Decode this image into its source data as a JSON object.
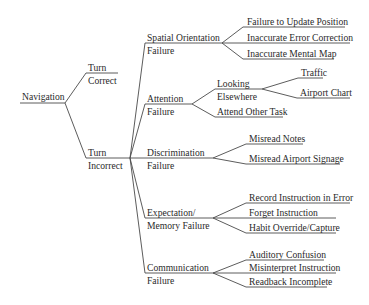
{
  "diagram": {
    "type": "tree",
    "line_color": "#4a4a4a",
    "text_color": "#2a2a2a",
    "root": {
      "label": "Navigation"
    },
    "level1": {
      "turn_correct": {
        "line1": "Turn",
        "line2": "Correct"
      },
      "turn_incorrect": {
        "line1": "Turn",
        "line2": "Incorrect"
      }
    },
    "level2": {
      "spatial": {
        "line1": "Spatial Orientation",
        "line2": "Failure"
      },
      "attention": {
        "line1": "Attention",
        "line2": "Failure"
      },
      "discrimination": {
        "line1": "Discrimination",
        "line2": "Failure"
      },
      "expectation": {
        "line1": "Expectation/",
        "line2": "Memory Failure"
      },
      "communication": {
        "line1": "Communication",
        "line2": "Failure"
      }
    },
    "level3": {
      "spatial": [
        "Failure to Update Position",
        "Inaccurate Error Correction",
        "Inaccurate Mental Map"
      ],
      "attention_looking": {
        "line1": "Looking",
        "line2": "Elsewhere"
      },
      "attention_other": "Attend Other Task",
      "discrimination": [
        "Misread Notes",
        "Misread Airport Signage"
      ],
      "expectation": [
        "Record Instruction in Error",
        "Forget Instruction",
        "Habit Override/Capture"
      ],
      "communication": [
        "Auditory Confusion",
        "Misinterpret Instruction",
        "Readback Incomplete"
      ]
    },
    "level4": {
      "looking_elsewhere": [
        "Traffic",
        "Airport Chart"
      ]
    }
  }
}
